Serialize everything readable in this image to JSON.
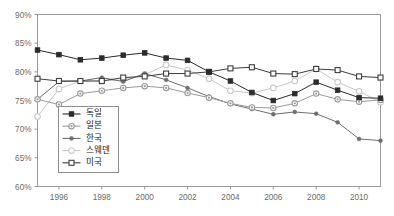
{
  "chart_data": {
    "type": "line",
    "title": "",
    "subtitle": "",
    "xlabel": "",
    "ylabel": "",
    "xlim": [
      1995,
      2011
    ],
    "ylim": [
      0.6,
      0.9
    ],
    "y_tick_labels": [
      "90%",
      "85%",
      "80%",
      "75%",
      "70%",
      "65%",
      "60%"
    ],
    "y_tick_values": [
      0.9,
      0.85,
      0.8,
      0.75,
      0.7,
      0.65,
      0.6
    ],
    "x_tick_labels": [
      "1996",
      "1998",
      "2000",
      "2002",
      "2004",
      "2006",
      "2008",
      "2010"
    ],
    "x_tick_values": [
      1996,
      1998,
      2000,
      2002,
      2004,
      2006,
      2008,
      2010
    ],
    "x": [
      1995,
      1996,
      1997,
      1998,
      1999,
      2000,
      2001,
      2002,
      2003,
      2004,
      2005,
      2006,
      2007,
      2008,
      2009,
      2010,
      2011
    ],
    "grid": false,
    "legend_position": "inside-lower-left",
    "series": [
      {
        "name": "독일",
        "color": "#2b2b2b",
        "marker": "filled-square",
        "values": [
          0.838,
          0.83,
          0.821,
          0.824,
          0.829,
          0.833,
          0.824,
          0.82,
          0.8,
          0.784,
          0.764,
          0.75,
          0.762,
          0.782,
          0.768,
          0.755,
          0.754
        ]
      },
      {
        "name": "일본",
        "color": "#9a9a9a",
        "marker": "dotted-circle",
        "values": [
          0.752,
          0.743,
          0.762,
          0.767,
          0.772,
          0.775,
          0.772,
          0.763,
          0.755,
          0.745,
          0.738,
          0.737,
          0.745,
          0.762,
          0.752,
          0.748,
          0.751
        ]
      },
      {
        "name": "한국",
        "color": "#6e6e6e",
        "marker": "small-filled",
        "values": [
          0.752,
          0.783,
          0.784,
          0.79,
          0.783,
          0.797,
          0.786,
          0.772,
          0.757,
          0.744,
          0.735,
          0.726,
          0.73,
          0.727,
          0.712,
          0.683,
          0.68
        ]
      },
      {
        "name": "스웨덴",
        "color": "#c9c9c9",
        "marker": "open-circle",
        "values": [
          0.722,
          0.77,
          0.784,
          0.784,
          0.786,
          0.795,
          0.812,
          0.803,
          0.788,
          0.767,
          0.763,
          0.772,
          0.784,
          0.805,
          0.782,
          0.766,
          0.747
        ]
      },
      {
        "name": "미국",
        "color": "#3d3d3d",
        "marker": "open-square",
        "values": [
          0.788,
          0.784,
          0.784,
          0.784,
          0.79,
          0.792,
          0.797,
          0.797,
          0.8,
          0.806,
          0.808,
          0.797,
          0.796,
          0.805,
          0.803,
          0.792,
          0.79
        ]
      }
    ]
  },
  "legend": {
    "items": [
      {
        "label": "독일"
      },
      {
        "label": "일본"
      },
      {
        "label": "한국"
      },
      {
        "label": "스웨덴"
      },
      {
        "label": "미국"
      }
    ]
  }
}
